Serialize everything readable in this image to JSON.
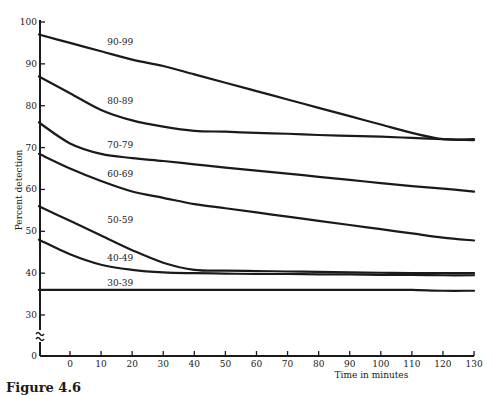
{
  "figure": {
    "caption": "Figure 4.6"
  },
  "chart_data": {
    "type": "line",
    "title": "",
    "xlabel": "Time in minutes",
    "ylabel": "Percent detection",
    "xlim": [
      -10,
      130
    ],
    "ylim": [
      0,
      100
    ],
    "y_axis_break": [
      0,
      30
    ],
    "grid": false,
    "legend": "inline labels on curves",
    "x_ticks": [
      "0",
      "10",
      "20",
      "30",
      "40",
      "50",
      "60",
      "70",
      "80",
      "90",
      "100",
      "110",
      "120",
      "130"
    ],
    "y_ticks": [
      "0",
      "30",
      "40",
      "50",
      "60",
      "70",
      "80",
      "90",
      "100"
    ],
    "x": [
      -10,
      0,
      10,
      20,
      30,
      40,
      50,
      60,
      70,
      80,
      90,
      100,
      110,
      120,
      130
    ],
    "series": [
      {
        "name": "90-99",
        "values": [
          97,
          95,
          93,
          91,
          89.5,
          87.5,
          85.5,
          83.5,
          81.5,
          79.5,
          77.5,
          75.5,
          73.5,
          72,
          72
        ]
      },
      {
        "name": "80-89",
        "values": [
          87,
          83,
          79,
          76.5,
          75,
          74,
          73.8,
          73.5,
          73.3,
          73,
          72.8,
          72.6,
          72.3,
          72,
          71.8
        ]
      },
      {
        "name": "70-79",
        "values": [
          76,
          71,
          68.5,
          67.5,
          66.8,
          66,
          65.2,
          64.5,
          63.8,
          63,
          62.3,
          61.5,
          60.8,
          60.2,
          59.5
        ]
      },
      {
        "name": "60-69",
        "values": [
          68.5,
          65,
          62,
          59.5,
          58,
          56.5,
          55.5,
          54.5,
          53.5,
          52.5,
          51.5,
          50.5,
          49.5,
          48.5,
          47.8
        ]
      },
      {
        "name": "50-59",
        "values": [
          56,
          52.5,
          49,
          45.5,
          42.5,
          40.8,
          40.6,
          40.5,
          40.4,
          40.3,
          40.2,
          40.1,
          40,
          40,
          40
        ]
      },
      {
        "name": "40-49",
        "values": [
          48,
          44.5,
          42,
          40.8,
          40.2,
          40,
          39.9,
          39.8,
          39.8,
          39.7,
          39.7,
          39.6,
          39.6,
          39.5,
          39.5
        ]
      },
      {
        "name": "30-39",
        "values": [
          36,
          36,
          36,
          36,
          36,
          36,
          36,
          36,
          36,
          36,
          36,
          36,
          36,
          35.8,
          35.8
        ]
      }
    ],
    "series_label_positions": [
      {
        "name": "90-99",
        "x": 12,
        "y": 94.5
      },
      {
        "name": "80-89",
        "x": 12,
        "y": 80.5
      },
      {
        "name": "70-79",
        "x": 12,
        "y": 70
      },
      {
        "name": "60-69",
        "x": 12,
        "y": 63
      },
      {
        "name": "50-59",
        "x": 12,
        "y": 52
      },
      {
        "name": "40-49",
        "x": 12,
        "y": 43
      },
      {
        "name": "30-39",
        "x": 12,
        "y": 37
      }
    ]
  },
  "colors": {
    "line": "#1a1a1a",
    "background": "#ffffff"
  }
}
